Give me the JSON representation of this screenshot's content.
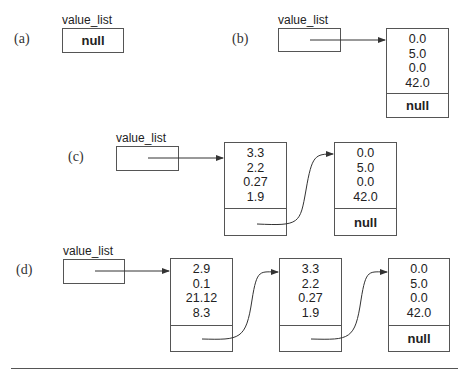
{
  "diagrams": [
    {
      "label": "(a)",
      "pointer": {
        "name": "value_list",
        "value": "null"
      },
      "nodes": []
    },
    {
      "label": "(b)",
      "pointer": {
        "name": "value_list",
        "value": ""
      },
      "nodes": [
        {
          "values": [
            "0.0",
            "5.0",
            "0.0",
            "42.0"
          ],
          "next": "null"
        }
      ]
    },
    {
      "label": "(c)",
      "pointer": {
        "name": "value_list",
        "value": ""
      },
      "nodes": [
        {
          "values": [
            "3.3",
            "2.2",
            "0.27",
            "1.9"
          ],
          "next": ""
        },
        {
          "values": [
            "0.0",
            "5.0",
            "0.0",
            "42.0"
          ],
          "next": "null"
        }
      ]
    },
    {
      "label": "(d)",
      "pointer": {
        "name": "value_list",
        "value": ""
      },
      "nodes": [
        {
          "values": [
            "2.9",
            "0.1",
            "21.12",
            "8.3"
          ],
          "next": ""
        },
        {
          "values": [
            "3.3",
            "2.2",
            "0.27",
            "1.9"
          ],
          "next": ""
        },
        {
          "values": [
            "0.0",
            "5.0",
            "0.0",
            "42.0"
          ],
          "next": "null"
        }
      ]
    }
  ],
  "colors": {
    "line": "#555555",
    "text": "#222222"
  }
}
